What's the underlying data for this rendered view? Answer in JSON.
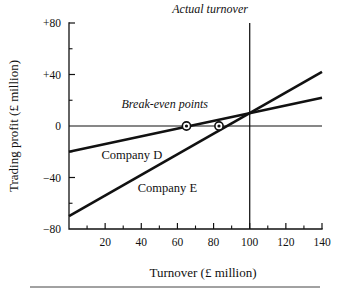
{
  "chart_data": {
    "type": "line",
    "title": "",
    "xlabel": "Turnover (£ million)",
    "ylabel": "Trading profit (£ million)",
    "xlim": [
      0,
      140
    ],
    "ylim": [
      -80,
      80
    ],
    "grid": false,
    "legend_position": "inline-labels",
    "x_ticks": [
      {
        "value": 20,
        "label": "20"
      },
      {
        "value": 40,
        "label": "40"
      },
      {
        "value": 60,
        "label": "60"
      },
      {
        "value": 80,
        "label": "80"
      },
      {
        "value": 100,
        "label": "100"
      },
      {
        "value": 120,
        "label": "120"
      },
      {
        "value": 140,
        "label": "140"
      }
    ],
    "x_minor_ticks": [
      10,
      30,
      50,
      70,
      90,
      110,
      130
    ],
    "y_ticks": [
      {
        "value": 80,
        "label": "+80"
      },
      {
        "value": 40,
        "label": "+40"
      },
      {
        "value": 0,
        "label": "0"
      },
      {
        "value": -40,
        "label": "−40"
      },
      {
        "value": -80,
        "label": "−80"
      }
    ],
    "y_minor_ticks": [
      60,
      20,
      -20,
      -60
    ],
    "series": [
      {
        "name": "Company D",
        "label": "Company D",
        "label_x": 18,
        "label_y": -26,
        "points": [
          [
            0,
            -20
          ],
          [
            140,
            22
          ]
        ]
      },
      {
        "name": "Company E",
        "label": "Company E",
        "label_x": 38,
        "label_y": -51,
        "points": [
          [
            0,
            -70
          ],
          [
            140,
            42
          ]
        ]
      }
    ],
    "annotations": [
      {
        "name": "break-even-points",
        "text": "Break-even points",
        "style": "italic",
        "x": 53,
        "y": 14
      },
      {
        "name": "actual-turnover",
        "text": "Actual turnover",
        "style": "italic",
        "x": 99,
        "y": 88,
        "anchor": "end"
      }
    ],
    "reference_lines": [
      {
        "name": "actual-turnover-line",
        "orientation": "vertical",
        "value": 100,
        "from": -80,
        "to": 80
      },
      {
        "name": "zero-profit-line",
        "orientation": "horizontal",
        "value": 0,
        "from": 0,
        "to": 140
      }
    ],
    "markers": [
      {
        "name": "break-even-company-d",
        "x": 65,
        "y": 0
      },
      {
        "name": "break-even-company-e",
        "x": 83,
        "y": 0
      }
    ],
    "colors": {
      "ink": "#111111",
      "background": "#ffffff",
      "rule": "#444444"
    }
  }
}
